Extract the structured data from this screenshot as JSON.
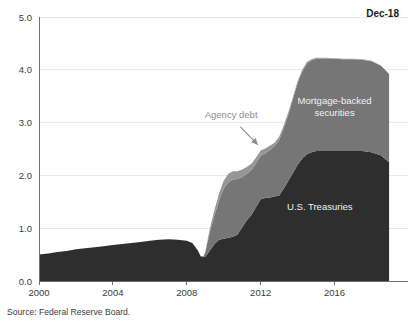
{
  "corner_note": "Dec-18",
  "source_note": "Source: Federal Reserve Board.",
  "annotation": {
    "agency_debt_label": "Agency debt"
  },
  "colors": {
    "treasuries": "#2e2e2e",
    "mbs": "#767676",
    "agency_debt": "#969696",
    "gridline": "#e8e8e8",
    "axis": "#6e6e6e",
    "background": "#ffffff",
    "inside_label_text": "#f2f2f2",
    "callout_text": "#8c8c8c"
  },
  "chart_data": {
    "type": "area",
    "stacked": true,
    "title": "",
    "subtitle": "",
    "xlabel": "",
    "ylabel": "",
    "xlim": [
      2000,
      2019
    ],
    "ylim": [
      0.0,
      5.0
    ],
    "grid": true,
    "legend_position": "inside-annotations",
    "x_tick_labels": [
      "2000",
      "2004",
      "2008",
      "2012",
      "2016"
    ],
    "x_tick_values": [
      2000,
      2004,
      2008,
      2012,
      2016
    ],
    "y_tick_labels": [
      "0.0",
      "1.0",
      "2.0",
      "3.0",
      "4.0",
      "5.0"
    ],
    "y_tick_values": [
      0.0,
      1.0,
      2.0,
      3.0,
      4.0,
      5.0
    ],
    "x": [
      2000.0,
      2000.5,
      2001.0,
      2001.5,
      2002.0,
      2002.5,
      2003.0,
      2003.5,
      2004.0,
      2004.5,
      2005.0,
      2005.5,
      2006.0,
      2006.5,
      2007.0,
      2007.5,
      2008.0,
      2008.3,
      2008.6,
      2008.75,
      2008.9,
      2009.0,
      2009.1,
      2009.25,
      2009.5,
      2009.75,
      2010.0,
      2010.25,
      2010.5,
      2010.75,
      2011.0,
      2011.25,
      2011.5,
      2011.75,
      2012.0,
      2012.25,
      2012.5,
      2012.75,
      2013.0,
      2013.25,
      2013.5,
      2013.75,
      2014.0,
      2014.25,
      2014.5,
      2014.75,
      2015.0,
      2015.5,
      2016.0,
      2016.5,
      2017.0,
      2017.5,
      2018.0,
      2018.5,
      2018.95
    ],
    "series": [
      {
        "name": "U.S. Treasuries",
        "color": "#2e2e2e",
        "label_position": {
          "x": 2015.2,
          "y": 1.35
        },
        "values": [
          0.5,
          0.52,
          0.55,
          0.57,
          0.6,
          0.62,
          0.64,
          0.66,
          0.68,
          0.7,
          0.72,
          0.74,
          0.76,
          0.78,
          0.79,
          0.78,
          0.76,
          0.72,
          0.58,
          0.47,
          0.45,
          0.46,
          0.5,
          0.58,
          0.7,
          0.78,
          0.8,
          0.82,
          0.84,
          0.88,
          1.02,
          1.15,
          1.25,
          1.4,
          1.55,
          1.57,
          1.58,
          1.6,
          1.62,
          1.75,
          1.9,
          2.05,
          2.2,
          2.32,
          2.4,
          2.44,
          2.46,
          2.46,
          2.46,
          2.46,
          2.46,
          2.46,
          2.44,
          2.38,
          2.25
        ]
      },
      {
        "name": "Mortgage-backed securities",
        "color": "#767676",
        "label_position": {
          "x": 2016.0,
          "y": 3.35
        },
        "values": [
          0.0,
          0.0,
          0.0,
          0.0,
          0.0,
          0.0,
          0.0,
          0.0,
          0.0,
          0.0,
          0.0,
          0.0,
          0.0,
          0.0,
          0.0,
          0.0,
          0.0,
          0.0,
          0.0,
          0.0,
          0.02,
          0.08,
          0.2,
          0.35,
          0.55,
          0.75,
          0.95,
          1.05,
          1.08,
          1.05,
          0.95,
          0.88,
          0.85,
          0.83,
          0.82,
          0.85,
          0.9,
          0.95,
          1.05,
          1.15,
          1.25,
          1.4,
          1.55,
          1.65,
          1.72,
          1.74,
          1.75,
          1.75,
          1.75,
          1.74,
          1.74,
          1.73,
          1.72,
          1.7,
          1.67
        ]
      },
      {
        "name": "Agency debt",
        "color": "#969696",
        "values": [
          0.0,
          0.0,
          0.0,
          0.0,
          0.0,
          0.0,
          0.0,
          0.0,
          0.0,
          0.0,
          0.0,
          0.0,
          0.0,
          0.0,
          0.0,
          0.0,
          0.0,
          0.0,
          0.0,
          0.0,
          0.0,
          0.01,
          0.03,
          0.07,
          0.1,
          0.13,
          0.15,
          0.16,
          0.16,
          0.15,
          0.14,
          0.13,
          0.12,
          0.11,
          0.1,
          0.09,
          0.08,
          0.07,
          0.06,
          0.05,
          0.05,
          0.04,
          0.04,
          0.03,
          0.03,
          0.02,
          0.02,
          0.02,
          0.01,
          0.01,
          0.01,
          0.01,
          0.01,
          0.0,
          0.0
        ]
      }
    ],
    "annotations": [
      {
        "text": "Agency debt",
        "text_x": 2010.4,
        "text_y": 3.08,
        "arrow_from_x": 2010.9,
        "arrow_from_y": 2.92,
        "arrow_to_x": 2011.85,
        "arrow_to_y": 2.58
      }
    ],
    "plot_area": {
      "left": 39,
      "right": 390,
      "top": 17,
      "bottom": 281
    }
  }
}
